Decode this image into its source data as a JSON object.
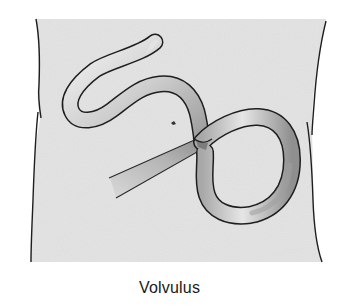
{
  "figure": {
    "caption": "Volvulus"
  },
  "colors": {
    "background": "#ffffff",
    "abdomen_fill": "#e4e4e4",
    "outline": "#1e1e1e",
    "bowel_light": "#f2f2f2",
    "bowel_mid": "#bdbdbd",
    "bowel_dark": "#8a8a8a"
  }
}
